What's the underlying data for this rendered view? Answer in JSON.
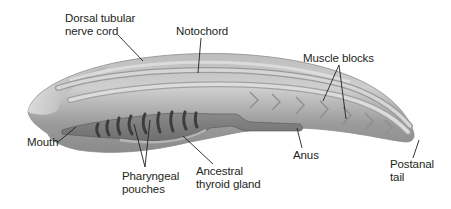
{
  "diagram": {
    "colors": {
      "body": "#a9a9a9",
      "body_light": "#d9d9d9",
      "body_dark": "#7a7a7a",
      "structure": "#c8c8c8",
      "pouch": "#5a5a5a",
      "leader_line": "#231f20",
      "text": "#231f20"
    },
    "labels": [
      {
        "id": "dorsal-nerve-cord",
        "text": "Dorsal tubular\nnerve cord"
      },
      {
        "id": "notochord",
        "text": "Notochord"
      },
      {
        "id": "muscle-blocks",
        "text": "Muscle blocks"
      },
      {
        "id": "mouth",
        "text": "Mouth"
      },
      {
        "id": "pharyngeal-pouches",
        "text": "Pharyngeal\npouches"
      },
      {
        "id": "ancestral-thyroid-gland",
        "text": "Ancestral\nthyroid gland"
      },
      {
        "id": "anus",
        "text": "Anus"
      },
      {
        "id": "postanal-tail",
        "text": "Postanal\ntail"
      }
    ]
  }
}
